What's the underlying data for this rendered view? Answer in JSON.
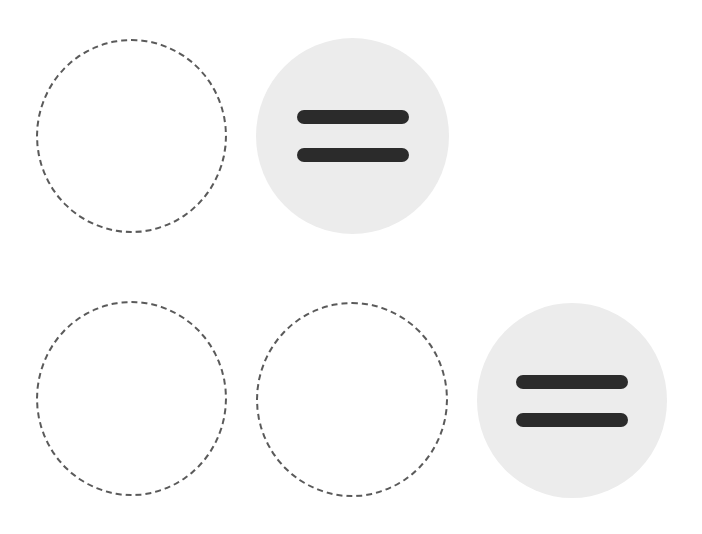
{
  "colors": {
    "background": "#ffffff",
    "dashed_outline": "#5a5a5a",
    "token_fill": "#ececec",
    "bar": "#2b2b2b"
  },
  "rows": [
    {
      "slots": [
        {
          "type": "empty",
          "icon": "dashed-circle"
        },
        {
          "type": "token",
          "icon": "equals-icon"
        }
      ]
    },
    {
      "slots": [
        {
          "type": "empty",
          "icon": "dashed-circle"
        },
        {
          "type": "empty",
          "icon": "dashed-circle"
        },
        {
          "type": "token",
          "icon": "equals-icon"
        }
      ]
    }
  ]
}
